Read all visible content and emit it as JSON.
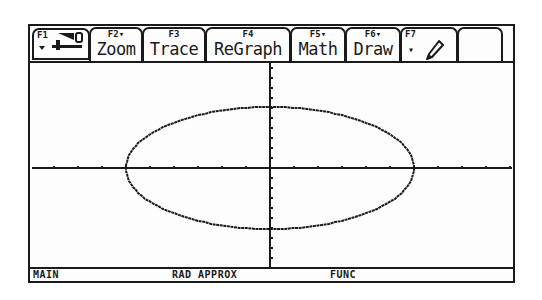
{
  "toolbar": {
    "tabs": [
      {
        "fkey": "F1",
        "label": "",
        "icon": "tools-icon"
      },
      {
        "fkey": "F2▾",
        "label": "Zoom"
      },
      {
        "fkey": "F3",
        "label": "Trace"
      },
      {
        "fkey": "F4",
        "label": "ReGraph"
      },
      {
        "fkey": "F5▾",
        "label": "Math"
      },
      {
        "fkey": "F6▾",
        "label": "Draw"
      },
      {
        "fkey": "F7",
        "label": "▾",
        "icon": "pencil-icon"
      },
      {
        "fkey": "",
        "label": ""
      }
    ]
  },
  "graph": {
    "x_tick_spacing_px": 24,
    "y_tick_spacing_px": 10,
    "x_ticks_each_side": 10,
    "y_ticks_each_side": 10,
    "ellipse": {
      "rx_units": 6,
      "ry_units": 6.1
    },
    "colors": {
      "ink": "#1a1a1a",
      "background": "#fdfdfd"
    }
  },
  "status": {
    "folder": "MAIN",
    "mode": "RAD APPROX",
    "graph_mode": "FUNC"
  }
}
